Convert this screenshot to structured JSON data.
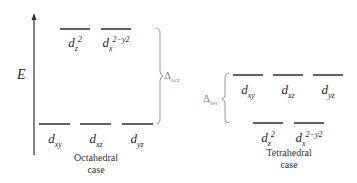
{
  "axis": {
    "label": "E"
  },
  "octahedral": {
    "upper": [
      {
        "d": "d",
        "sub": "z",
        "sup": "2",
        "x": 75
      },
      {
        "d": "d",
        "sub": "x",
        "sup": "2−y2",
        "x": 116
      }
    ],
    "lower": [
      {
        "d": "d",
        "sub": "xy",
        "x": 55
      },
      {
        "d": "d",
        "sub": "xz",
        "x": 96
      },
      {
        "d": "d",
        "sub": "yz",
        "x": 137
      }
    ],
    "caption_line1": "Octahedral",
    "caption_line2": "case",
    "delta": {
      "symbol": "Δ",
      "sub": "oct"
    }
  },
  "tetrahedral": {
    "upper": [
      {
        "d": "d",
        "sub": "xy",
        "x": 248
      },
      {
        "d": "d",
        "sub": "xz",
        "x": 288
      },
      {
        "d": "d",
        "sub": "yz",
        "x": 328
      }
    ],
    "lower": [
      {
        "d": "d",
        "sub": "z",
        "sup": "2",
        "x": 268
      },
      {
        "d": "d",
        "sub": "x",
        "sup": "2−y2",
        "x": 309
      }
    ],
    "caption_line1": "Tetrahedral",
    "caption_line2": "case",
    "delta": {
      "symbol": "Δ",
      "sub": "tet"
    }
  },
  "colors": {
    "line": "#3a3a3a",
    "brace": "#999999"
  }
}
